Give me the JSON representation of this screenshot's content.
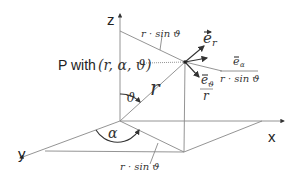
{
  "diagram": {
    "axes": {
      "x": "x",
      "y": "y",
      "z": "z"
    },
    "point_label": "P with",
    "point_coords": "(r, α, ϑ)",
    "radius_label": "r",
    "theta_label": "ϑ",
    "alpha_label": "α",
    "top_projection_label": "r · sin ϑ",
    "floor_projection_label": "r · sin ϑ",
    "unit_vectors": {
      "e_r": "e",
      "e_r_sub": "r",
      "e_alpha": "e",
      "e_alpha_sub": "α",
      "e_alpha_denominator": "r · sin ϑ",
      "e_theta": "e",
      "e_theta_sub": "ϑ",
      "e_theta_denominator": "r"
    }
  }
}
